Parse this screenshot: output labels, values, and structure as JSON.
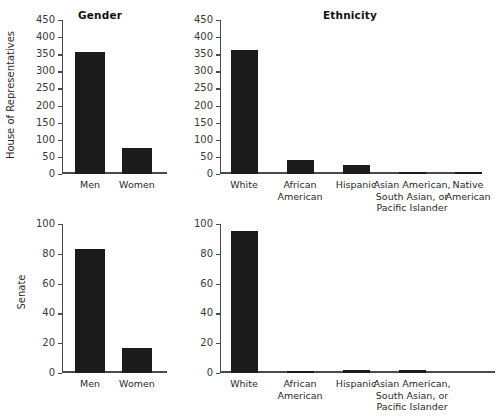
{
  "chart_data": [
    {
      "type": "bar",
      "title": "Gender",
      "row_label": "House of Representatives",
      "categories": [
        "Men",
        "Women"
      ],
      "values": [
        358,
        76
      ],
      "xlabel": "",
      "ylabel": "House of Representatives",
      "ylim": [
        0,
        450
      ],
      "yticks": [
        0,
        50,
        100,
        150,
        200,
        250,
        300,
        350,
        400,
        450
      ],
      "grid": false,
      "legend": "none",
      "bar_color": "#1b1b1b"
    },
    {
      "type": "bar",
      "title": "Ethnicity",
      "row_label": "House of Representatives",
      "categories": [
        "White",
        "African American",
        "Hispanic",
        "Asian American, South Asian, or Pacific Islander",
        "Native American"
      ],
      "values": [
        363,
        41,
        27,
        3,
        2
      ],
      "xlabel": "",
      "ylabel": "House of Representatives",
      "ylim": [
        0,
        450
      ],
      "yticks": [
        0,
        50,
        100,
        150,
        200,
        250,
        300,
        350,
        400,
        450
      ],
      "grid": false,
      "legend": "none",
      "bar_color": "#1b1b1b"
    },
    {
      "type": "bar",
      "title": "",
      "row_label": "Senate",
      "categories": [
        "Men",
        "Women"
      ],
      "values": [
        83,
        17
      ],
      "xlabel": "",
      "ylabel": "Senate",
      "ylim": [
        0,
        100
      ],
      "yticks": [
        0,
        20,
        40,
        60,
        80,
        100
      ],
      "grid": false,
      "legend": "none",
      "bar_color": "#1b1b1b"
    },
    {
      "type": "bar",
      "title": "",
      "row_label": "Senate",
      "categories": [
        "White",
        "African American",
        "Hispanic",
        "Asian American, South Asian, or Pacific Islander"
      ],
      "values": [
        95,
        1,
        2,
        2
      ],
      "xlabel": "",
      "ylabel": "Senate",
      "ylim": [
        0,
        100
      ],
      "yticks": [
        0,
        20,
        40,
        60,
        80,
        100
      ],
      "grid": false,
      "legend": "none",
      "bar_color": "#1b1b1b"
    }
  ],
  "panels": {
    "house_gender": {
      "title": "Gender",
      "ylabel": "House of Representatives",
      "yticks": [
        "450",
        "400",
        "350",
        "300",
        "250",
        "200",
        "150",
        "100",
        "50",
        "0"
      ],
      "cats": [
        {
          "label_line1": "Men",
          "label_line2": "",
          "label_line3": ""
        },
        {
          "label_line1": "Women",
          "label_line2": "",
          "label_line3": ""
        }
      ]
    },
    "house_ethnicity": {
      "title": "Ethnicity",
      "yticks": [
        "450",
        "400",
        "350",
        "300",
        "250",
        "200",
        "150",
        "100",
        "50",
        "0"
      ],
      "cats": [
        {
          "label_line1": "White",
          "label_line2": "",
          "label_line3": ""
        },
        {
          "label_line1": "African",
          "label_line2": "American",
          "label_line3": ""
        },
        {
          "label_line1": "Hispanic",
          "label_line2": "",
          "label_line3": ""
        },
        {
          "label_line1": "Asian American,",
          "label_line2": "South Asian, or",
          "label_line3": "Pacific Islander"
        },
        {
          "label_line1": "Native",
          "label_line2": "American",
          "label_line3": ""
        }
      ]
    },
    "senate_gender": {
      "ylabel": "Senate",
      "yticks": [
        "100",
        "80",
        "60",
        "40",
        "20",
        "0"
      ],
      "cats": [
        {
          "label_line1": "Men",
          "label_line2": "",
          "label_line3": ""
        },
        {
          "label_line1": "Women",
          "label_line2": "",
          "label_line3": ""
        }
      ]
    },
    "senate_ethnicity": {
      "yticks": [
        "100",
        "80",
        "60",
        "40",
        "20",
        "0"
      ],
      "cats": [
        {
          "label_line1": "White",
          "label_line2": "",
          "label_line3": ""
        },
        {
          "label_line1": "African",
          "label_line2": "American",
          "label_line3": ""
        },
        {
          "label_line1": "Hispanic",
          "label_line2": "",
          "label_line3": ""
        },
        {
          "label_line1": "Asian American,",
          "label_line2": "South Asian, or",
          "label_line3": "Pacific Islander"
        }
      ]
    }
  }
}
